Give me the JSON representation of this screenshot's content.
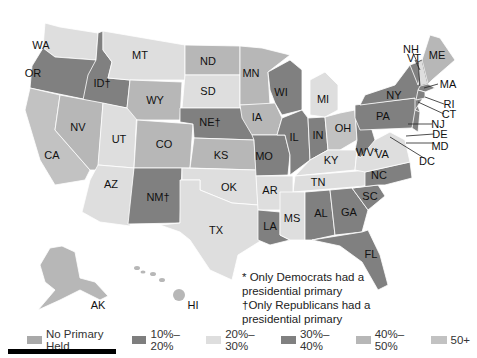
{
  "colors": {
    "no_primary": "#a9a9a9",
    "p10_20": "#7e7e7e",
    "p20_30": "#dedede",
    "p30_40": "#808080",
    "p40_50": "#b7b7b7",
    "p50_plus": "#c2c2c2"
  },
  "states": [
    {
      "abbr": "WA",
      "x": 41,
      "y": 45
    },
    {
      "abbr": "OR",
      "x": 33,
      "y": 73
    },
    {
      "abbr": "ID†",
      "x": 102,
      "y": 83
    },
    {
      "abbr": "MT",
      "x": 140,
      "y": 55
    },
    {
      "abbr": "ND",
      "x": 208,
      "y": 61
    },
    {
      "abbr": "SD",
      "x": 208,
      "y": 91
    },
    {
      "abbr": "MN",
      "x": 251,
      "y": 73
    },
    {
      "abbr": "WI",
      "x": 281,
      "y": 92
    },
    {
      "abbr": "MI",
      "x": 323,
      "y": 99
    },
    {
      "abbr": "WY",
      "x": 155,
      "y": 100
    },
    {
      "abbr": "NE†",
      "x": 210,
      "y": 122
    },
    {
      "abbr": "IA",
      "x": 257,
      "y": 117
    },
    {
      "abbr": "IL",
      "x": 294,
      "y": 137
    },
    {
      "abbr": "IN",
      "x": 318,
      "y": 135
    },
    {
      "abbr": "OH",
      "x": 343,
      "y": 128
    },
    {
      "abbr": "NV",
      "x": 78,
      "y": 127
    },
    {
      "abbr": "UT",
      "x": 119,
      "y": 139
    },
    {
      "abbr": "CO",
      "x": 164,
      "y": 144
    },
    {
      "abbr": "KS",
      "x": 221,
      "y": 155
    },
    {
      "abbr": "MO",
      "x": 264,
      "y": 156
    },
    {
      "abbr": "KY",
      "x": 331,
      "y": 160
    },
    {
      "abbr": "WV*",
      "x": 367,
      "y": 152
    },
    {
      "abbr": "VA",
      "x": 382,
      "y": 154
    },
    {
      "abbr": "CA",
      "x": 52,
      "y": 155
    },
    {
      "abbr": "AZ",
      "x": 111,
      "y": 184
    },
    {
      "abbr": "NM†",
      "x": 158,
      "y": 197
    },
    {
      "abbr": "OK",
      "x": 229,
      "y": 187
    },
    {
      "abbr": "AR",
      "x": 270,
      "y": 190
    },
    {
      "abbr": "TN",
      "x": 318,
      "y": 182
    },
    {
      "abbr": "NC",
      "x": 379,
      "y": 175
    },
    {
      "abbr": "SC",
      "x": 370,
      "y": 196
    },
    {
      "abbr": "GA",
      "x": 349,
      "y": 212
    },
    {
      "abbr": "AL",
      "x": 321,
      "y": 213
    },
    {
      "abbr": "MS",
      "x": 292,
      "y": 218
    },
    {
      "abbr": "LA",
      "x": 270,
      "y": 226
    },
    {
      "abbr": "TX",
      "x": 216,
      "y": 230
    },
    {
      "abbr": "FL",
      "x": 371,
      "y": 254
    },
    {
      "abbr": "AK",
      "x": 98,
      "y": 305
    },
    {
      "abbr": "HI",
      "x": 193,
      "y": 305
    },
    {
      "abbr": "NY",
      "x": 394,
      "y": 95
    },
    {
      "abbr": "PA",
      "x": 383,
      "y": 116
    },
    {
      "abbr": "VT",
      "x": 414,
      "y": 58
    },
    {
      "abbr": "NH",
      "x": 411,
      "y": 49
    },
    {
      "abbr": "ME",
      "x": 437,
      "y": 55
    },
    {
      "abbr": "MA",
      "x": 448,
      "y": 84
    },
    {
      "abbr": "RI",
      "x": 449,
      "y": 104
    },
    {
      "abbr": "CT",
      "x": 449,
      "y": 114
    },
    {
      "abbr": "NJ",
      "x": 438,
      "y": 124
    },
    {
      "abbr": "DE",
      "x": 440,
      "y": 134
    },
    {
      "abbr": "MD",
      "x": 440,
      "y": 146
    },
    {
      "abbr": "DC",
      "x": 427,
      "y": 161
    }
  ],
  "notes": {
    "line1": "* Only Democrats had a",
    "line2": "presidential primary",
    "line3": "†Only Republicans had a",
    "line4": "presidential primary"
  },
  "legend": [
    {
      "label": "No Primary Held",
      "color": "#a9a9a9"
    },
    {
      "label": "10%–20%",
      "color": "#7e7e7e"
    },
    {
      "label": "20%–30%",
      "color": "#dedede"
    },
    {
      "label": "30%–40%",
      "color": "#808080"
    },
    {
      "label": "40%–50%",
      "color": "#b7b7b7"
    },
    {
      "label": "50+",
      "color": "#c2c2c2"
    }
  ]
}
